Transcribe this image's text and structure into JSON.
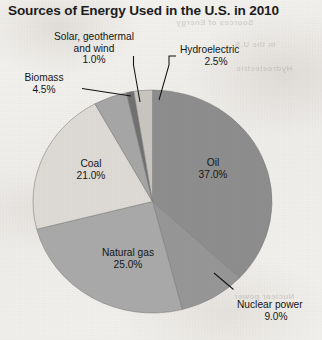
{
  "title": "Sources of Energy Used in the U.S. in 2010",
  "background_bleed": [
    "Sources of Energy",
    "in the U.S.",
    "Hydroelectric",
    "Nuclear power"
  ],
  "chart_data": {
    "type": "pie",
    "title": "Sources of Energy Used in the U.S. in 2010",
    "xlabel": "",
    "ylabel": "",
    "units": "percent",
    "total": 100.0,
    "start_angle_deg": 0,
    "direction": "clockwise",
    "legend": "none",
    "grid": false,
    "categories": [
      "Oil",
      "Nuclear power",
      "Natural gas",
      "Coal",
      "Biomass",
      "Solar, geothermal and wind",
      "Hydroelectric"
    ],
    "values": [
      37.0,
      9.0,
      25.0,
      21.0,
      4.5,
      1.0,
      2.5
    ],
    "slices": [
      {
        "name": "Oil",
        "label": "Oil",
        "value_label": "37.0%",
        "value": 37.0,
        "color": "#8d8d8d",
        "label_placement": "inside",
        "label_x": 213,
        "label_y": 163
      },
      {
        "name": "Nuclear power",
        "label": "Nuclear power",
        "value_label": "9.0%",
        "value": 9.0,
        "color": "#969696",
        "label_placement": "callout",
        "label_x": 245,
        "label_y": 305
      },
      {
        "name": "Natural gas",
        "label": "Natural gas",
        "value_label": "25.0%",
        "value": 25.0,
        "color": "#a9a9a9",
        "label_placement": "inside",
        "label_x": 128,
        "label_y": 253
      },
      {
        "name": "Coal",
        "label": "Coal",
        "value_label": "21.0%",
        "value": 21.0,
        "color": "#dedad6",
        "label_placement": "inside",
        "label_x": 91,
        "label_y": 164
      },
      {
        "name": "Biomass",
        "label": "Biomass",
        "value_label": "4.5%",
        "value": 4.5,
        "color": "#a6a6a6",
        "label_placement": "callout",
        "label_x": 44,
        "label_y": 77
      },
      {
        "name": "Solar, geothermal and wind",
        "label": "Solar, geothermal",
        "label_line2": "and wind",
        "value_label": "1.0%",
        "value": 1.0,
        "color": "#6f6f6f",
        "label_placement": "callout",
        "label_x": 94,
        "label_y": 36
      },
      {
        "name": "Hydroelectric",
        "label": "Hydroelectric",
        "value_label": "2.5%",
        "value": 2.5,
        "color": "#c9c5c1",
        "label_placement": "callout",
        "label_x": 207,
        "label_y": 48
      }
    ],
    "geometry": {
      "center_x": 152.5,
      "center_y": 201.5,
      "radius_x": 119.5,
      "radius_y": 111.5
    }
  }
}
